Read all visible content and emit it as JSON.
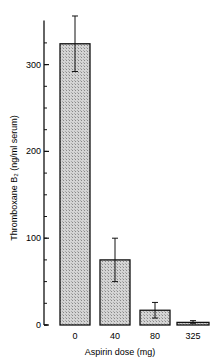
{
  "chart_data": {
    "type": "bar",
    "title": "",
    "xlabel": "Aspirin dose (mg)",
    "ylabel": "Thromboxane B₂ (ng/ml serum)",
    "categories": [
      "0",
      "40",
      "80",
      "325"
    ],
    "values": [
      324,
      75,
      17,
      3
    ],
    "error_upper": [
      356,
      100,
      26,
      5
    ],
    "error_lower": [
      292,
      50,
      8,
      2
    ],
    "ylim": [
      0,
      360
    ],
    "yticks": [
      0,
      100,
      200,
      300
    ],
    "yticks_minor_step": 25,
    "grid": false,
    "legend": null,
    "bar_fill": "crosshatch-gray"
  }
}
